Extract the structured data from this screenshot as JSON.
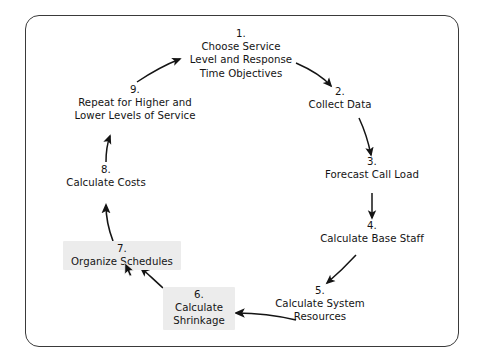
{
  "diagram": {
    "type": "circular-process-flow",
    "frame": {
      "style": "rounded-rectangle-border",
      "color": "#3a3a3a"
    },
    "highlight_color": "#ececec",
    "text_color": "#141414",
    "steps": [
      {
        "number": "1.",
        "label": "Choose Service\nLevel and Response\nTime Objectives",
        "lines": [
          "Choose Service",
          "Level and Response",
          "Time Objectives"
        ],
        "highlighted": false
      },
      {
        "number": "2.",
        "label": "Collect Data",
        "lines": [
          "Collect Data"
        ],
        "highlighted": false
      },
      {
        "number": "3.",
        "label": "Forecast Call Load",
        "lines": [
          "Forecast Call Load"
        ],
        "highlighted": false
      },
      {
        "number": "4.",
        "label": "Calculate Base Staff",
        "lines": [
          "Calculate Base Staff"
        ],
        "highlighted": false
      },
      {
        "number": "5.",
        "label": "Calculate System\nResources",
        "lines": [
          "Calculate System",
          "Resources"
        ],
        "highlighted": false
      },
      {
        "number": "6.",
        "label": "Calculate\nShrinkage",
        "lines": [
          "Calculate",
          "Shrinkage"
        ],
        "highlighted": true
      },
      {
        "number": "7.",
        "label": "Organize Schedules",
        "lines": [
          "Organize Schedules"
        ],
        "highlighted": true
      },
      {
        "number": "8.",
        "label": "Calculate Costs",
        "lines": [
          "Calculate Costs"
        ],
        "highlighted": false
      },
      {
        "number": "9.",
        "label": "Repeat for Higher and\nLower Levels of Service",
        "lines": [
          "Repeat for Higher and",
          "Lower Levels of Service"
        ],
        "highlighted": false
      }
    ],
    "connections": [
      {
        "from": "1.",
        "to": "2."
      },
      {
        "from": "2.",
        "to": "3."
      },
      {
        "from": "3.",
        "to": "4."
      },
      {
        "from": "4.",
        "to": "5."
      },
      {
        "from": "5.",
        "to": "6."
      },
      {
        "from": "6.",
        "to": "7."
      },
      {
        "from": "7.",
        "to": "8."
      },
      {
        "from": "8.",
        "to": "9."
      },
      {
        "from": "9.",
        "to": "1."
      }
    ]
  }
}
